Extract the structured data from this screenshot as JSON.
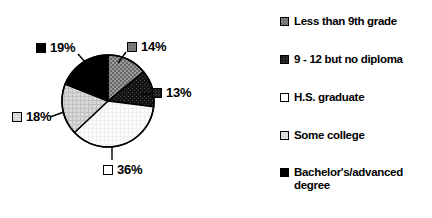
{
  "chart_data": {
    "type": "pie",
    "title": "",
    "subtitle": "",
    "xlabel": "",
    "ylabel": "",
    "categories": [
      "Less than 9th grade",
      "9 - 12 but no diploma",
      "H.S. graduate",
      "Some college",
      "Bachelor's/advanced degree"
    ],
    "values": [
      14,
      13,
      36,
      18,
      19
    ],
    "value_labels": [
      "14%",
      "13%",
      "36%",
      "18%",
      "19%"
    ],
    "units": "percent",
    "start_angle_deg": 0,
    "direction": "clockwise",
    "legend_position": "right",
    "grid": false,
    "slice_fills": [
      "gray-hatch",
      "dark",
      "white",
      "light-gray",
      "black"
    ],
    "colors": {
      "less_than_9th_grade": "#8f8f8f",
      "grade_9_12_no_diploma": "#1a1a1a",
      "hs_graduate": "#ffffff",
      "some_college": "#d4d4d4",
      "bachelors_advanced_degree": "#000000",
      "outline": "#000000",
      "background": "#ffffff"
    }
  },
  "pie": {
    "center_x": 108,
    "center_y": 101,
    "radius": 46,
    "slices": [
      {
        "label": "14%",
        "value": 14,
        "fill": "fill-gray-hatch",
        "name": "less-than-9th-grade"
      },
      {
        "label": "13%",
        "value": 13,
        "fill": "fill-dark",
        "name": "grade-9-12-no-diploma"
      },
      {
        "label": "36%",
        "value": 36,
        "fill": "fill-white",
        "name": "hs-graduate"
      },
      {
        "label": "18%",
        "value": 18,
        "fill": "fill-light-gray",
        "name": "some-college"
      },
      {
        "label": "19%",
        "value": 19,
        "fill": "fill-black",
        "name": "bachelors-advanced-degree"
      }
    ]
  },
  "legend": {
    "items": [
      {
        "label": "Less than 9th grade",
        "fill": "fill-gray-hatch"
      },
      {
        "label": "9 - 12 but no diploma",
        "fill": "fill-dark"
      },
      {
        "label": "H.S. graduate",
        "fill": "fill-white"
      },
      {
        "label": "Some college",
        "fill": "fill-light-gray"
      },
      {
        "label": "Bachelor's/advanced degree",
        "fill": "fill-black"
      }
    ]
  }
}
